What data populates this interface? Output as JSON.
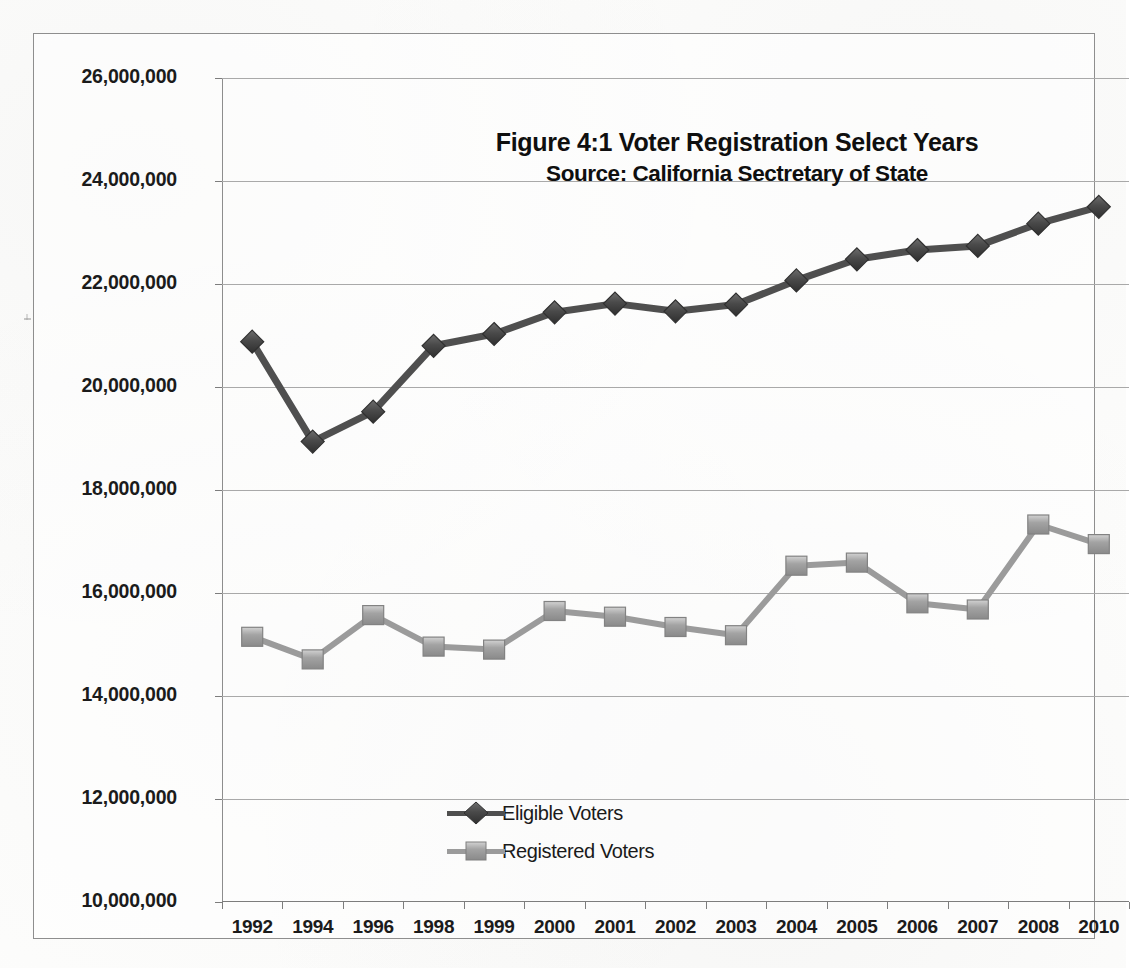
{
  "chart_data": {
    "type": "line",
    "title": "Figure 4:1 Voter Registration Select Years",
    "subtitle": "Source: California Sectretary of State",
    "xlabel": "",
    "ylabel": "",
    "grid": true,
    "legend_position": "inside-bottom-left",
    "ylim": [
      10000000,
      26000000
    ],
    "ytick_step": 2000000,
    "ytick_labels": [
      "26,000,000",
      "24,000,000",
      "22,000,000",
      "20,000,000",
      "18,000,000",
      "16,000,000",
      "14,000,000",
      "12,000,000",
      "10,000,000"
    ],
    "ytick_values": [
      26000000,
      24000000,
      22000000,
      20000000,
      18000000,
      16000000,
      14000000,
      12000000,
      10000000
    ],
    "categories": [
      "1992",
      "1994",
      "1996",
      "1998",
      "1999",
      "2000",
      "2001",
      "2002",
      "2003",
      "2004",
      "2005",
      "2006",
      "2007",
      "2008",
      "2010"
    ],
    "series": [
      {
        "name": "Eligible Voters",
        "color": "#4f4f4f",
        "marker": "diamond",
        "values": [
          20880000,
          18940000,
          19520000,
          20800000,
          21030000,
          21450000,
          21620000,
          21470000,
          21600000,
          22070000,
          22480000,
          22660000,
          22740000,
          23170000,
          23500000
        ]
      },
      {
        "name": "Registered Voters",
        "color": "#9b9b9b",
        "marker": "square",
        "values": [
          15150000,
          14710000,
          15570000,
          14960000,
          14900000,
          15650000,
          15540000,
          15340000,
          15180000,
          16530000,
          16590000,
          15800000,
          15680000,
          17330000,
          16950000
        ]
      }
    ]
  },
  "legend": {
    "items": [
      {
        "label": "Eligible Voters"
      },
      {
        "label": "Registered Voters"
      }
    ]
  },
  "colors": {
    "eligible": "#4f4f4f",
    "registered": "#9b9b9b",
    "grid": "#a9a9a9",
    "frame": "#8e8e8e",
    "text": "#1b1b1b"
  }
}
